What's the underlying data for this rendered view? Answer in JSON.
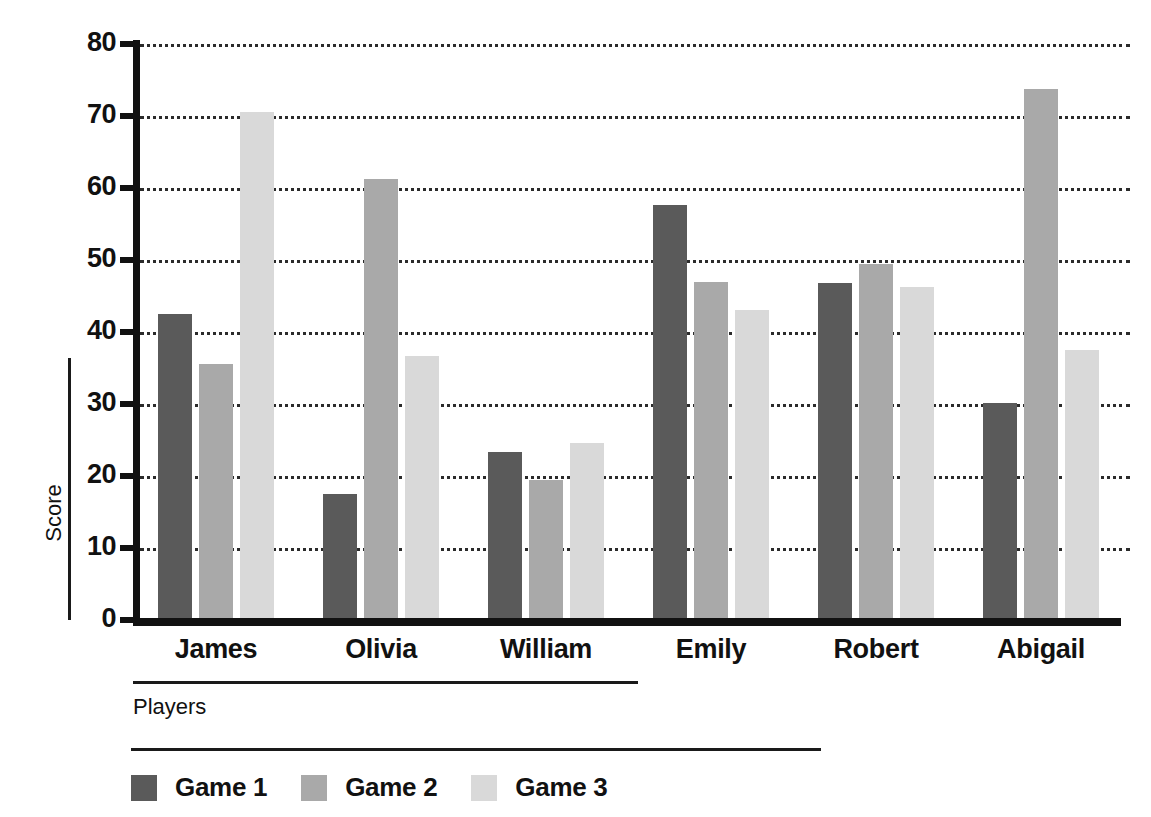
{
  "chart_data": {
    "type": "bar",
    "title": "",
    "xlabel": "Players",
    "ylabel": "Score",
    "categories": [
      "James",
      "Olivia",
      "William",
      "Emily",
      "Robert",
      "Abigail"
    ],
    "series": [
      {
        "name": "Game 1",
        "color": "#5a5a5a",
        "values": [
          42.5,
          17.5,
          23.4,
          57.7,
          46.8,
          30.1
        ]
      },
      {
        "name": "Game 2",
        "color": "#a9a9a9",
        "values": [
          35.6,
          61.3,
          19.5,
          46.9,
          49.4,
          73.8
        ]
      },
      {
        "name": "Game 3",
        "color": "#d9d9d9",
        "values": [
          70.5,
          36.7,
          24.6,
          43.0,
          46.2,
          37.5
        ]
      }
    ],
    "ylim": [
      0,
      80
    ],
    "ytick_step": 10,
    "yticks": [
      "80",
      "70",
      "60",
      "50",
      "40",
      "30",
      "20",
      "10",
      "0"
    ],
    "grid": true,
    "grid_style": "dotted",
    "legend_position": "bottom-left",
    "legend": [
      "Game 1",
      "Game 2",
      "Game 3"
    ]
  },
  "axes": {
    "y_title": "Score",
    "x_title": "Players"
  }
}
